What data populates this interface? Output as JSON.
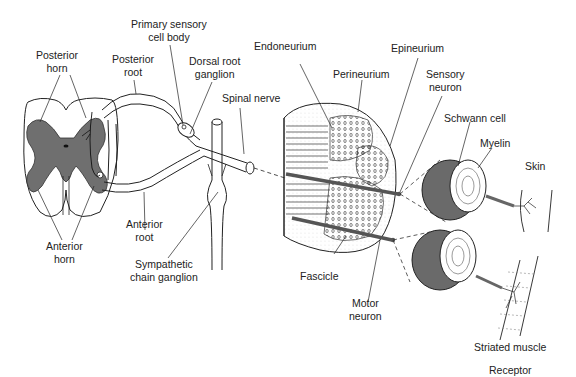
{
  "diagram": {
    "colors": {
      "gray_matter": "#6f6f6f",
      "myelin_outer": "#6a6a6a",
      "line": "#222222",
      "background": "#ffffff"
    },
    "labels": {
      "posterior_horn": [
        "Posterior",
        "horn"
      ],
      "posterior_root": [
        "Posterior",
        "root"
      ],
      "primary_sensory_cell_body": [
        "Primary sensory",
        "cell body"
      ],
      "dorsal_root_ganglion": [
        "Dorsal root",
        "ganglion"
      ],
      "spinal_nerve": "Spinal nerve",
      "anterior_horn": [
        "Anterior",
        "horn"
      ],
      "anterior_root": [
        "Anterior",
        "root"
      ],
      "sympathetic_chain_ganglion": [
        "Sympathetic",
        "chain ganglion"
      ],
      "endoneurium": "Endoneurium",
      "perineurium": "Perineurium",
      "epineurium": "Epineurium",
      "sensory_neuron": [
        "Sensory",
        "neuron"
      ],
      "schwann_cell": "Schwann cell",
      "myelin": "Myelin",
      "skin": "Skin",
      "fascicle": "Fascicle",
      "motor_neuron": [
        "Motor",
        "neuron"
      ],
      "striated_muscle": "Striated muscle",
      "receptor": "Receptor"
    }
  }
}
